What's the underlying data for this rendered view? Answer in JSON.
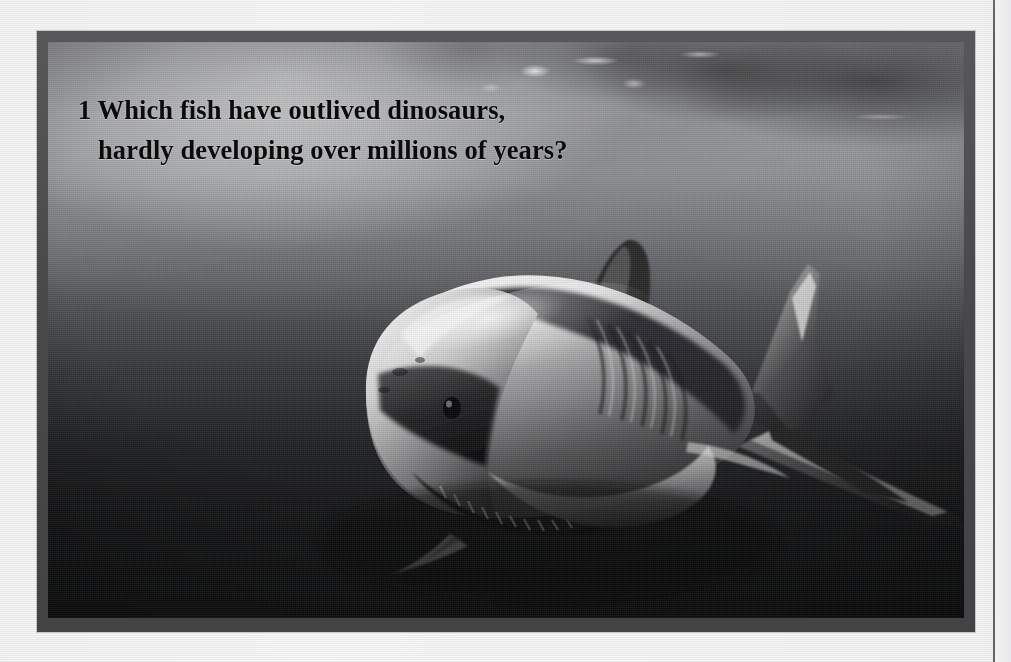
{
  "page": {
    "background_color": "#eeeef0",
    "gutter_line_color": "#46464a"
  },
  "photo_frame": {
    "border_color": "#4a4a4d",
    "border_width_px": 11
  },
  "photo": {
    "alt_name": "great-white-shark-underwater-photograph",
    "subject": "great white shark",
    "scene": "underwater, light from surface above",
    "palette": {
      "water_light": "#b9babd",
      "water_dark": "#161718",
      "shark_highlight": "#f0f0f0",
      "shark_shadow": "#1a1a1c"
    }
  },
  "question": {
    "number": "1",
    "line1": "1 Which fish have outlived dinosaurs,",
    "line2": "hardly developing over millions of years?",
    "full_text": "1 Which fish have outlived dinosaurs, hardly developing over millions of years?",
    "text_color": "#0b0b0c"
  }
}
